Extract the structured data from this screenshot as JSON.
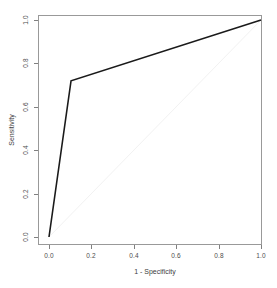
{
  "chart_data": {
    "type": "line",
    "title": "",
    "subtitle": "",
    "xlabel": "1 - Specificity",
    "ylabel": "Sensitivity",
    "xlim": [
      0.0,
      1.0
    ],
    "ylim": [
      0.0,
      1.0
    ],
    "grid": false,
    "legend": null,
    "xticks": [
      "0.0",
      "0.2",
      "0.4",
      "0.6",
      "0.8",
      "1.0"
    ],
    "xtick_values": [
      0.0,
      0.2,
      0.4,
      0.6,
      0.8,
      1.0
    ],
    "yticks": [
      "0.0",
      "0.2",
      "0.4",
      "0.6",
      "0.8",
      "1.0"
    ],
    "ytick_values": [
      0.0,
      0.2,
      0.4,
      0.6,
      0.8,
      1.0
    ],
    "series": [
      {
        "name": "ROC curve",
        "color": "#1a1a1a",
        "linewidth": 1.6,
        "x": [
          0.0,
          0.104,
          1.0
        ],
        "y": [
          0.0,
          0.72,
          1.0
        ]
      },
      {
        "name": "chance diagonal",
        "color": "#f2f2f2",
        "linewidth": 1.0,
        "x": [
          0.0,
          1.0
        ],
        "y": [
          0.0,
          1.0
        ]
      }
    ],
    "annotations": []
  },
  "plot": {
    "background_color": "#ffffff",
    "border_color": "#999999",
    "tick_color": "#808080",
    "tick_label_color": "#4d4d4d",
    "axis_title_color": "#3d3d3d",
    "box": {
      "left": 38,
      "top": 15,
      "right": 262,
      "bottom": 245
    },
    "data_origin_px": {
      "x0": 49,
      "y0": 237,
      "x1": 261,
      "y1": 20
    }
  },
  "axes": {
    "x": {
      "title": "1 - Specificity",
      "ticks": [
        {
          "label": "0.0",
          "px": 49
        },
        {
          "label": "0.2",
          "px": 91
        },
        {
          "label": "0.4",
          "px": 134
        },
        {
          "label": "0.6",
          "px": 176
        },
        {
          "label": "0.8",
          "px": 219
        },
        {
          "label": "1.0",
          "px": 261
        }
      ]
    },
    "y": {
      "title": "Sensitivity",
      "ticks": [
        {
          "label": "0.0",
          "px": 237
        },
        {
          "label": "0.2",
          "px": 194
        },
        {
          "label": "0.4",
          "px": 150
        },
        {
          "label": "0.6",
          "px": 107
        },
        {
          "label": "0.8",
          "px": 63
        },
        {
          "label": "1.0",
          "px": 20
        }
      ]
    }
  }
}
